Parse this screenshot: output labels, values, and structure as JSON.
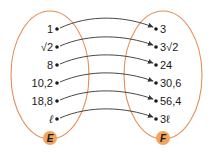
{
  "colors": {
    "oval_stroke": "#e0905a",
    "badge_fill": "#f2a35e",
    "arrow": "#333333",
    "dot": "#1a1a1a",
    "text": "#1a1a1a"
  },
  "sets": {
    "domain": {
      "name": "E",
      "elements": [
        "1",
        "√2",
        "8",
        "10,2",
        "18,8",
        "ℓ"
      ]
    },
    "codomain": {
      "name": "F",
      "elements": [
        "3",
        "3√2",
        "24",
        "30,6",
        "56,4",
        "3ℓ"
      ]
    }
  },
  "mappings": [
    {
      "from": "1",
      "to": "3"
    },
    {
      "from": "√2",
      "to": "3√2"
    },
    {
      "from": "8",
      "to": "24"
    },
    {
      "from": "10,2",
      "to": "30,6"
    },
    {
      "from": "18,8",
      "to": "56,4"
    },
    {
      "from": "ℓ",
      "to": "3ℓ"
    }
  ]
}
